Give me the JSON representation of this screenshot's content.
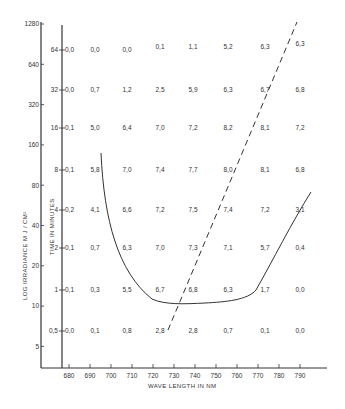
{
  "chart_data": {
    "type": "table",
    "title": "",
    "xlabel": "WAVE LENGTH IN NM",
    "ylabel_outer": "LOG IRRADIANCE M J / CM²",
    "ylabel_inner": "TIME IN MINUTES",
    "x_ticks": [
      "680",
      "690",
      "700",
      "710",
      "720",
      "730",
      "740",
      "750",
      "760",
      "770",
      "780",
      "790"
    ],
    "y_outer_ticks": [
      "1280",
      "640",
      "320",
      "160",
      "80",
      "40",
      "20",
      "10",
      "5"
    ],
    "time_rows": [
      {
        "time": "64",
        "edge": "0,0",
        "values": [
          "0,0",
          "0,0",
          "0,1",
          "1,1",
          "5,2",
          "6,3",
          "6,3"
        ]
      },
      {
        "time": "32",
        "edge": "0,0",
        "values": [
          "0,7",
          "1,2",
          "2,5",
          "5,9",
          "6,3",
          "6,7",
          "6,8"
        ]
      },
      {
        "time": "16",
        "edge": "0,1",
        "values": [
          "5,0",
          "6,4",
          "7,0",
          "7,2",
          "8,2",
          "8,1",
          "7,2"
        ]
      },
      {
        "time": "8",
        "edge": "0,1",
        "values": [
          "5,8",
          "7,0",
          "7,4",
          "7,7",
          "8,0",
          "8,1",
          "6,8"
        ]
      },
      {
        "time": "4",
        "edge": "0,2",
        "values": [
          "4,1",
          "6,6",
          "7,2",
          "7,5",
          "7,4",
          "7,2",
          "3,1"
        ]
      },
      {
        "time": "2",
        "edge": "0,1",
        "values": [
          "0,7",
          "6,3",
          "7,0",
          "7,3",
          "7,1",
          "5,7",
          "0,4"
        ]
      },
      {
        "time": "1",
        "edge": "0,1",
        "values": [
          "0,3",
          "5,5",
          "6,7",
          "6,8",
          "6,3",
          "1,7",
          "0,0"
        ]
      },
      {
        "time": "0,5",
        "edge": "0,0",
        "values": [
          "0,1",
          "0,8",
          "2,8",
          "2,8",
          "0,7",
          "0,1",
          "0,0"
        ]
      }
    ],
    "curves": [
      {
        "name": "threshold curve",
        "style": "solid"
      },
      {
        "name": "trend line",
        "style": "dashed"
      }
    ],
    "grid": false,
    "legend": "none"
  }
}
